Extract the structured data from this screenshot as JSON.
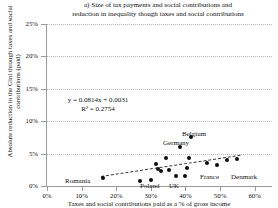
{
  "chart_data": {
    "type": "scatter",
    "title": "a) Size of tax payments and social contributions and reduction in inequality though taxes and social contributions",
    "title_line1": "a) Size of tax payments and social contributions and",
    "title_line2": "reduction in inequality though taxes and social contributions",
    "xlabel": "Taxes and social contributions paid as a % of gross income",
    "ylabel": "Absolute reduction in the Gini through taxes and social contributions (paid)",
    "xlim": [
      0,
      0.65
    ],
    "ylim": [
      0,
      0.25
    ],
    "xticks": [
      0,
      0.1,
      0.2,
      0.3,
      0.4,
      0.5,
      0.6
    ],
    "xticklabels": [
      "0%",
      "10%",
      "20%",
      "30%",
      "40%",
      "50%",
      "60%"
    ],
    "yticks": [
      0,
      0.05,
      0.1,
      0.15,
      0.2,
      0.25
    ],
    "yticklabels": [
      "0%",
      "5%",
      "10%",
      "15%",
      "20%",
      "25%"
    ],
    "grid": "horizontal-dotted",
    "legend": "none",
    "marker": "filled-diamond-black",
    "trendline": {
      "style": "dashed",
      "equation": "y = 0.0814x + 0.0031",
      "r2": "R² = 0.2754",
      "slope": 0.0814,
      "intercept": 0.0031,
      "r_squared": 0.2754
    },
    "points": [
      {
        "x": 0.162,
        "y": 0.012,
        "label": "Romania"
      },
      {
        "x": 0.268,
        "y": 0.008,
        "label": "Poland"
      },
      {
        "x": 0.3,
        "y": 0.009,
        "label": "UK"
      },
      {
        "x": 0.315,
        "y": 0.034,
        "label": ""
      },
      {
        "x": 0.322,
        "y": 0.027,
        "label": ""
      },
      {
        "x": 0.33,
        "y": 0.023,
        "label": ""
      },
      {
        "x": 0.345,
        "y": 0.043,
        "label": ""
      },
      {
        "x": 0.352,
        "y": 0.025,
        "label": ""
      },
      {
        "x": 0.372,
        "y": 0.016,
        "label": ""
      },
      {
        "x": 0.383,
        "y": 0.06,
        "label": "Germany"
      },
      {
        "x": 0.399,
        "y": 0.015,
        "label": "France"
      },
      {
        "x": 0.404,
        "y": 0.028,
        "label": ""
      },
      {
        "x": 0.41,
        "y": 0.043,
        "label": ""
      },
      {
        "x": 0.415,
        "y": 0.075,
        "label": "Belgium"
      },
      {
        "x": 0.463,
        "y": 0.036,
        "label": ""
      },
      {
        "x": 0.492,
        "y": 0.032,
        "label": ""
      },
      {
        "x": 0.52,
        "y": 0.04,
        "label": ""
      },
      {
        "x": 0.548,
        "y": 0.041,
        "label": "Denmark"
      }
    ],
    "point_labels": [
      {
        "text": "Belgium",
        "x_px": 182,
        "y_px": 130
      },
      {
        "text": "Germany",
        "x_px": 163,
        "y_px": 139
      },
      {
        "text": "France",
        "x_px": 200,
        "y_px": 173
      },
      {
        "text": "Denmark",
        "x_px": 231,
        "y_px": 173
      },
      {
        "text": "Romania",
        "x_px": 65,
        "y_px": 177
      },
      {
        "text": "Poland",
        "x_px": 140,
        "y_px": 182
      },
      {
        "text": "UK",
        "x_px": 169,
        "y_px": 182
      }
    ]
  }
}
